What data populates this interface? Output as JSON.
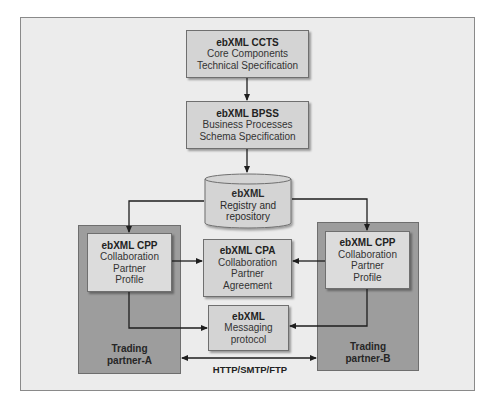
{
  "diagram": {
    "nodes": {
      "ccts": {
        "title": "ebXML CCTS",
        "lines": [
          "Core Components",
          "Technical Specification"
        ]
      },
      "bpss": {
        "title": "ebXML BPSS",
        "lines": [
          "Business Processes",
          "Schema Specification"
        ]
      },
      "registry": {
        "title": "ebXML",
        "lines": [
          "Registry and",
          "repository"
        ],
        "shape": "cylinder"
      },
      "cpp_a": {
        "title": "ebXML CPP",
        "lines": [
          "Collaboration",
          "Partner",
          "Profile"
        ]
      },
      "cpa": {
        "title": "ebXML CPA",
        "lines": [
          "Collaboration",
          "Partner",
          "Agreement"
        ]
      },
      "cpp_b": {
        "title": "ebXML CPP",
        "lines": [
          "Collaboration",
          "Partner",
          "Profile"
        ]
      },
      "messaging": {
        "title": "ebXML",
        "lines": [
          "Messaging",
          "protocol"
        ]
      }
    },
    "groups": {
      "partner_a": {
        "lines": [
          "Trading",
          "partner-A"
        ]
      },
      "partner_b": {
        "lines": [
          "Trading",
          "partner-B"
        ]
      }
    },
    "edges": [
      {
        "from": "ccts",
        "to": "bpss"
      },
      {
        "from": "bpss",
        "to": "registry"
      },
      {
        "from": "registry",
        "to": "cpp_a"
      },
      {
        "from": "registry",
        "to": "cpp_b"
      },
      {
        "from": "cpp_a",
        "to": "cpa"
      },
      {
        "from": "cpp_b",
        "to": "cpa"
      },
      {
        "from": "cpp_a",
        "to": "messaging"
      },
      {
        "from": "cpp_b",
        "to": "messaging"
      },
      {
        "from": "partner_a",
        "to": "partner_b",
        "bidirectional": true,
        "label": "HTTP/SMTP/FTP"
      }
    ],
    "protocol_label": "HTTP/SMTP/FTP"
  },
  "colors": {
    "frame_bg": "#ececec",
    "partner_bg": "#9d9d9d",
    "box_bg": "#d4d4d4",
    "line": "#1e1e1e"
  }
}
